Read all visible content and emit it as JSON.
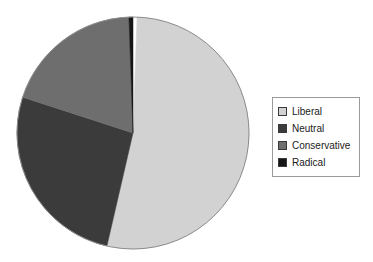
{
  "chart_data": {
    "type": "pie",
    "title": "",
    "subtitle": "",
    "xlabel": "",
    "ylabel": "",
    "grid": false,
    "legend_position": "right",
    "start_angle_deg": 0,
    "direction": "clockwise",
    "categories": [
      "Liberal",
      "Neutral",
      "Conservative",
      "Radical"
    ],
    "values": [
      53,
      26,
      20,
      1
    ],
    "value_unit": "percent",
    "colors": [
      "#d2d2d2",
      "#3b3b3b",
      "#6e6e6e",
      "#151515"
    ],
    "slices": [
      {
        "label": "Liberal",
        "value": 53,
        "percent": 53,
        "angle_deg": 191,
        "start_deg": 2,
        "end_deg": 193,
        "color": "#d2d2d2"
      },
      {
        "label": "Neutral",
        "value": 26,
        "percent": 26,
        "angle_deg": 95,
        "start_deg": 193,
        "end_deg": 288,
        "color": "#3b3b3b"
      },
      {
        "label": "Conservative",
        "value": 20,
        "percent": 20,
        "angle_deg": 70,
        "start_deg": 288,
        "end_deg": 358,
        "color": "#6e6e6e"
      },
      {
        "label": "Radical",
        "value": 1,
        "percent": 1,
        "angle_deg": 2,
        "start_deg": 358,
        "end_deg": 360,
        "color": "#151515"
      }
    ],
    "geometry": {
      "center_x": 133,
      "center_y": 133,
      "radius": 116,
      "outline_color": "#8c8c8c"
    }
  },
  "legend": {
    "border_color": "#9a9a9a",
    "items": [
      {
        "label": "Liberal",
        "color": "#d2d2d2"
      },
      {
        "label": "Neutral",
        "color": "#3b3b3b"
      },
      {
        "label": "Conservative",
        "color": "#6e6e6e"
      },
      {
        "label": "Radical",
        "color": "#151515"
      }
    ]
  },
  "canvas": {
    "background": "#ffffff",
    "width": 373,
    "height": 262
  }
}
